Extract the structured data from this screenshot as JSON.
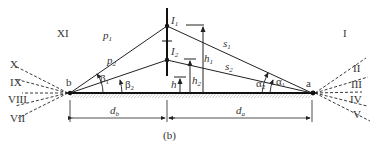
{
  "figure": {
    "caption": "(b)",
    "points": {
      "a": "a",
      "b": "b"
    },
    "sources": {
      "upper": "I",
      "lower": "I",
      "upper_sub": "1",
      "lower_sub": "2"
    },
    "paths": {
      "p1": "p",
      "p1_sub": "1",
      "p2": "p",
      "p2_sub": "2",
      "s1": "s",
      "s1_sub": "1",
      "s2": "s",
      "s2_sub": "2"
    },
    "heights": {
      "h": "h",
      "h1": "h",
      "h1_sub": "1",
      "h2": "h",
      "h2_sub": "2"
    },
    "angles": {
      "beta1": "β",
      "beta1_sub": "1",
      "beta2": "β",
      "beta2_sub": "2",
      "alpha1": "α",
      "alpha1_sub": "1",
      "alpha2": "α",
      "alpha2_sub": "2"
    },
    "distances": {
      "db": "d",
      "db_sub": "b",
      "da": "d",
      "da_sub": "a"
    },
    "sectors_left": [
      "XI",
      "X",
      "IX",
      "VIII",
      "VII"
    ],
    "sectors_right": [
      "I",
      "II",
      "III",
      "IV",
      "V"
    ]
  }
}
